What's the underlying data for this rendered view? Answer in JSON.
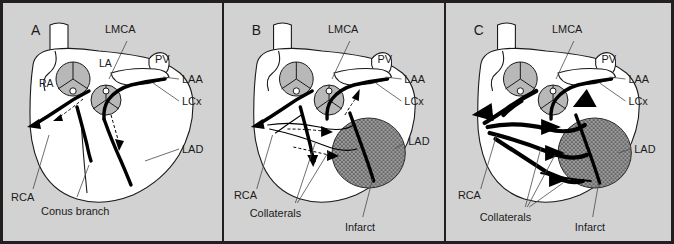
{
  "figure": {
    "type": "medical-illustration",
    "panel_count": 3,
    "background_color": "#d2d2d2",
    "border_color": "#231f20"
  },
  "panels": [
    {
      "letter": "A",
      "caption_stage": "normal",
      "labels": [
        {
          "key": "lmca",
          "text": "LMCA"
        },
        {
          "key": "pv",
          "text": "PV"
        },
        {
          "key": "laa",
          "text": "LAA"
        },
        {
          "key": "lcx",
          "text": "LCx"
        },
        {
          "key": "lad",
          "text": "LAD"
        },
        {
          "key": "rca",
          "text": "RCA"
        },
        {
          "key": "conus",
          "text": "Conus branch"
        }
      ],
      "inline_labels": [
        {
          "key": "la",
          "text": "LA"
        },
        {
          "key": "ra",
          "text": "RA"
        }
      ]
    },
    {
      "letter": "B",
      "caption_stage": "early-collaterals",
      "labels": [
        {
          "key": "lmca",
          "text": "LMCA"
        },
        {
          "key": "pv",
          "text": "PV"
        },
        {
          "key": "laa",
          "text": "LAA"
        },
        {
          "key": "lcx",
          "text": "LCx"
        },
        {
          "key": "lad",
          "text": "LAD"
        },
        {
          "key": "rca",
          "text": "RCA"
        },
        {
          "key": "collaterals",
          "text": "Collaterals"
        },
        {
          "key": "infarct",
          "text": "Infarct"
        }
      ],
      "inline_labels": []
    },
    {
      "letter": "C",
      "caption_stage": "mature-collaterals",
      "labels": [
        {
          "key": "lmca",
          "text": "LMCA"
        },
        {
          "key": "pv",
          "text": "PV"
        },
        {
          "key": "laa",
          "text": "LAA"
        },
        {
          "key": "lcx",
          "text": "LCx"
        },
        {
          "key": "lad",
          "text": "LAD"
        },
        {
          "key": "rca",
          "text": "RCA"
        },
        {
          "key": "collaterals",
          "text": "Collaterals"
        },
        {
          "key": "infarct",
          "text": "Infarct"
        }
      ],
      "inline_labels": []
    }
  ],
  "legend_terms": {
    "LMCA": "Left main coronary artery",
    "PV": "Pulmonary vein",
    "LAA": "Left atrial appendage",
    "LCx": "Left circumflex artery",
    "LAD": "Left anterior descending artery",
    "RCA": "Right coronary artery",
    "LA": "Left atrium",
    "RA": "Right atrium"
  },
  "colors": {
    "background": "#d2d2d2",
    "organ_fill": "#ffffff",
    "outline": "#1a1a1a",
    "vessel": "#000000",
    "valve_shade": "#b8b8b8",
    "infarct_fill": "#9a9a9a"
  }
}
